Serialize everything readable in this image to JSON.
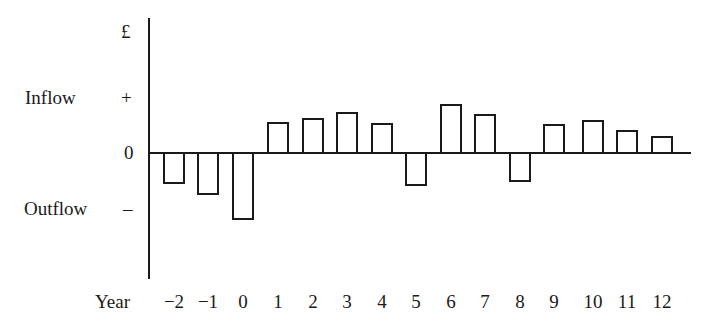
{
  "chart_data": {
    "type": "bar",
    "title": "",
    "xlabel": "Year",
    "ylabel": "£",
    "categories": [
      "-2",
      "-1",
      "0",
      "1",
      "2",
      "3",
      "4",
      "5",
      "6",
      "7",
      "8",
      "9",
      "10",
      "11",
      "12"
    ],
    "values": [
      -30,
      -41,
      -66,
      30,
      34,
      40,
      29,
      -32,
      48,
      38,
      -28,
      28,
      32,
      22,
      16
    ],
    "value_units": "relative (px above zero line; + tick ≈ 55, − tick ≈ -55)",
    "y_ticks": [
      {
        "label": "+",
        "meaning": "Inflow"
      },
      {
        "label": "0",
        "meaning": ""
      },
      {
        "label": "–",
        "meaning": "Outflow"
      }
    ],
    "grid": false,
    "legend": null
  },
  "labels": {
    "currency": "£",
    "inflow": "Inflow",
    "outflow": "Outflow",
    "plus": "+",
    "zero": "0",
    "minus": "–",
    "year": "Year",
    "x_ticks": [
      "−2",
      "−1",
      "0",
      "1",
      "2",
      "3",
      "4",
      "5",
      "6",
      "7",
      "8",
      "9",
      "10",
      "11",
      "12"
    ]
  },
  "colors": {
    "ink": "#1a1a1a",
    "background": "#ffffff"
  }
}
